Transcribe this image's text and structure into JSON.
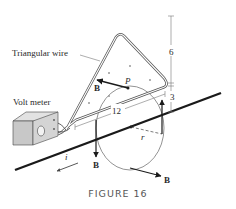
{
  "figure": {
    "caption": "FIGURE 16",
    "labels": {
      "triangular_wire": "Triangular wire",
      "volt_meter": "Volt meter",
      "point_p": "P",
      "current": "i",
      "radius": "r",
      "field_top_left": "B",
      "field_bottom_left": "B",
      "field_bottom_right": "B"
    },
    "dimensions": {
      "height_top": "6",
      "height_bottom": "3",
      "base_length": "12"
    }
  },
  "colors": {
    "line": "#1a1a1a",
    "wire_outline": "#555555",
    "dimension": "#777777",
    "box_front": "#c8c8c8",
    "box_top": "#e2e2e2",
    "box_side": "#b0b0b0",
    "dot": "#999999"
  }
}
